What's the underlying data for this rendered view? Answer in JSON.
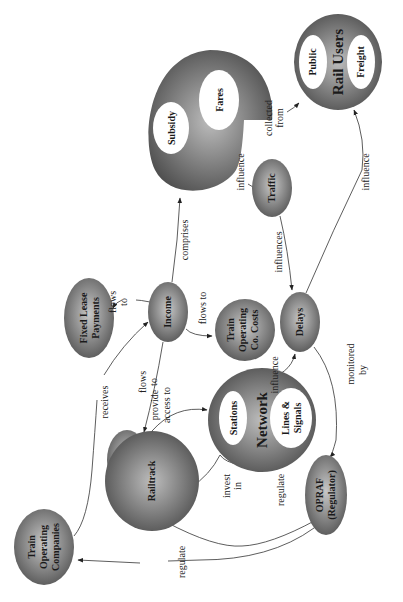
{
  "diagram": {
    "orientation": "rotated -90deg (text reads bottom-to-top)",
    "colors": {
      "node_fill_dark": "#5a5a5a",
      "node_fill_light": "#bdbdbd",
      "inner_fill": "#ffffff",
      "edge": "#333333",
      "background": "#ffffff"
    },
    "nodes": {
      "rail_users": {
        "label": "Rail Users",
        "children": [
          "Public",
          "Freight"
        ]
      },
      "income_sources": {
        "label": "",
        "children": [
          "Subsidy",
          "Fares"
        ]
      },
      "traffic": {
        "label": "Traffic"
      },
      "delays": {
        "label": "Delays"
      },
      "income": {
        "label": "Income"
      },
      "toc_costs": {
        "lines": [
          "Train",
          "Operating",
          "Co. Costs"
        ]
      },
      "fixed_lease": {
        "lines": [
          "Fixed Lease",
          "Payments"
        ]
      },
      "fixed_charges": {
        "lines": [
          "Fixed",
          "Charges"
        ]
      },
      "network": {
        "label": "Network",
        "children": [
          "Stations",
          "Lines &",
          "Signals"
        ]
      },
      "railtrack": {
        "label": "Railtrack"
      },
      "opraf": {
        "lines": [
          "OPRAF",
          "(Regulator)"
        ]
      },
      "tocs": {
        "lines": [
          "Train",
          "Operating",
          "Companies"
        ]
      }
    },
    "edges": [
      {
        "from": "Fares",
        "to": "Rail Users",
        "label_lines": [
          "collected",
          "from"
        ]
      },
      {
        "from": "Fares",
        "to": "Traffic",
        "label_lines": [
          "influence"
        ]
      },
      {
        "from": "Delays",
        "to": "Rail Users",
        "label_lines": [
          "influence"
        ]
      },
      {
        "from": "Traffic",
        "to": "Delays",
        "label_lines": [
          "influences"
        ]
      },
      {
        "from": "Income",
        "to": "Subsidy/Fares",
        "label_lines": [
          "comprises"
        ]
      },
      {
        "from": "Income",
        "to": "Fixed Lease Payments",
        "label_lines": [
          "flows",
          "to"
        ]
      },
      {
        "from": "Income",
        "to": "Fixed Charges",
        "label_lines": [
          "flows",
          "to"
        ]
      },
      {
        "from": "Income",
        "to": "Train Operating Co. Costs",
        "label_lines": [
          "flows to"
        ]
      },
      {
        "from": "Train Operating Companies",
        "to": "Income",
        "label_lines": [
          "receives"
        ]
      },
      {
        "from": "Network",
        "to": "Delays",
        "label_lines": [
          "influence"
        ]
      },
      {
        "from": "Delays",
        "to": "OPRAF (Regulator)",
        "label_lines": [
          "monitored",
          "by"
        ]
      },
      {
        "from": "Railtrack",
        "to": "Network",
        "label_lines": [
          "provide",
          "access to"
        ]
      },
      {
        "from": "Railtrack",
        "to": "Network",
        "label_lines": [
          "invest",
          "in"
        ]
      },
      {
        "from": "OPRAF (Regulator)",
        "to": "Railtrack",
        "label_lines": [
          "regulate"
        ]
      },
      {
        "from": "OPRAF (Regulator)",
        "to": "Train Operating Companies",
        "label_lines": [
          "regulate"
        ]
      }
    ]
  }
}
